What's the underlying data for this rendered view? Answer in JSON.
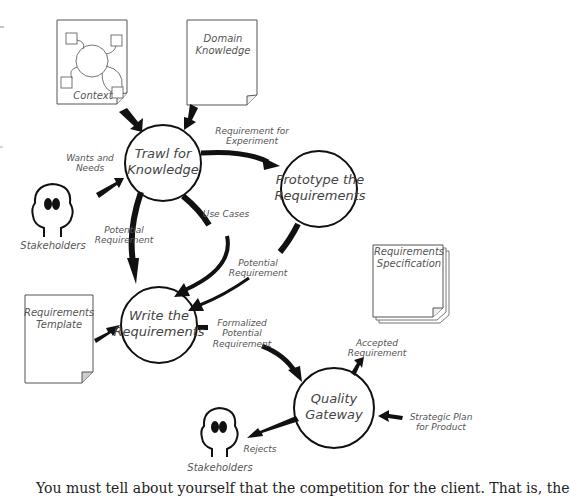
{
  "diagram": {
    "processes": [
      {
        "id": "trawl",
        "label_line1": "Trawl for",
        "label_line2": "Knowledge"
      },
      {
        "id": "prototype",
        "label_line1": "Prototype the",
        "label_line2": "Requirements"
      },
      {
        "id": "write",
        "label_line1": "Write the",
        "label_line2": "Requirements"
      },
      {
        "id": "gateway",
        "label_line1": "Quality",
        "label_line2": "Gateway"
      }
    ],
    "documents": [
      {
        "id": "context",
        "label_line1": "Context",
        "label_line2": ""
      },
      {
        "id": "domain",
        "label_line1": "Domain",
        "label_line2": "Knowledge"
      },
      {
        "id": "template",
        "label_line1": "Requirements",
        "label_line2": "Template"
      },
      {
        "id": "spec",
        "label_line1": "Requirements",
        "label_line2": "Specification"
      }
    ],
    "actors": [
      {
        "id": "stakeholders_top",
        "label": "Stakeholders"
      },
      {
        "id": "stakeholders_bottom",
        "label": "Stakeholders"
      }
    ],
    "flows": {
      "wants_needs": {
        "line1": "Wants and",
        "line2": "Needs"
      },
      "req_experiment": {
        "line1": "Requirement for",
        "line2": "Experiment"
      },
      "use_cases": {
        "line1": "Use Cases"
      },
      "potential_left": {
        "line1": "Potential",
        "line2": "Requirement"
      },
      "potential_right": {
        "line1": "Potential",
        "line2": "Requirement"
      },
      "formalized": {
        "line1": "Formalized",
        "line2": "Potential",
        "line3": "Requirement"
      },
      "accepted": {
        "line1": "Accepted",
        "line2": "Requirement"
      },
      "strategic": {
        "line1": "Strategic Plan",
        "line2": "for Product"
      },
      "rejects": {
        "line1": "Rejects"
      }
    },
    "colors": {
      "stroke": "#111111",
      "doc_border": "#555555",
      "text": "#555555",
      "fold_fill": "#dddddd"
    }
  },
  "footer": {
    "text": "You must tell about yourself that the competition for the client. That is, the"
  }
}
